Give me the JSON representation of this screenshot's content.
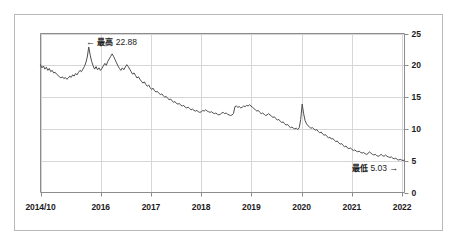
{
  "figure": {
    "name": "interest-rate-history-line-chart",
    "background_color": "#ffffff",
    "frame_color": "#b9b9b9",
    "line_color": "#4d4d4d",
    "grid_color": "#d6d6d6",
    "axis_color": "#8c8c8c"
  },
  "annotations": {
    "high": {
      "arrow": "←",
      "label": "最高",
      "value": "22.88",
      "full": "← 最高 22.88"
    },
    "low": {
      "arrow": "→",
      "label": "最低",
      "value": "5.03",
      "full": "最低 5.03→"
    }
  },
  "chart_data": {
    "type": "line",
    "title": "",
    "subtitle": "",
    "xlabel": "",
    "ylabel": "",
    "grid": true,
    "legend": null,
    "ylim": [
      0,
      25
    ],
    "yticks": [
      0,
      5,
      10,
      15,
      20,
      25
    ],
    "ytick_labels": [
      "0",
      "5",
      "10",
      "15",
      "20",
      "25"
    ],
    "xlim": [
      "2014/10",
      "2022"
    ],
    "xticks": [
      "2014/10",
      "2016",
      "2017",
      "2018",
      "2019",
      "2020",
      "2021",
      "2022"
    ],
    "xtick_labels": [
      "2014/10",
      "2016",
      "2017",
      "2018",
      "2019",
      "2020",
      "2021",
      "2022"
    ],
    "xtick_fractions": [
      0.0,
      0.1653,
      0.3033,
      0.4413,
      0.5793,
      0.7173,
      0.8553,
      0.9933
    ],
    "max_value": 22.88,
    "min_value": 5.03,
    "series": [
      {
        "name": "rate",
        "values": [
          20.1,
          19.6,
          19.9,
          19.4,
          19.7,
          19.2,
          19.5,
          19.0,
          19.2,
          18.8,
          18.9,
          18.6,
          18.4,
          18.2,
          18.0,
          18.2,
          17.9,
          18.1,
          17.8,
          18.0,
          18.3,
          18.1,
          18.5,
          18.3,
          18.7,
          18.5,
          18.9,
          19.2,
          19.0,
          19.4,
          19.8,
          20.4,
          21.3,
          22.88,
          21.6,
          20.6,
          19.9,
          19.4,
          19.8,
          19.3,
          19.6,
          19.2,
          19.5,
          19.9,
          20.3,
          20.0,
          20.6,
          21.0,
          21.4,
          21.8,
          21.4,
          20.9,
          20.4,
          19.9,
          19.5,
          19.2,
          19.6,
          19.3,
          19.7,
          20.1,
          19.8,
          19.4,
          19.0,
          18.6,
          18.8,
          18.4,
          18.0,
          18.2,
          17.8,
          17.5,
          17.2,
          17.4,
          17.0,
          16.7,
          16.9,
          16.5,
          16.2,
          16.4,
          16.0,
          15.8,
          15.9,
          15.6,
          15.4,
          15.5,
          15.2,
          15.0,
          15.1,
          14.8,
          14.6,
          14.7,
          14.4,
          14.2,
          14.3,
          14.0,
          13.9,
          14.0,
          13.7,
          13.6,
          13.7,
          13.4,
          13.3,
          13.4,
          13.2,
          13.0,
          13.1,
          12.9,
          12.8,
          12.9,
          12.7,
          12.6,
          12.7,
          12.9,
          12.8,
          13.0,
          12.8,
          12.7,
          12.6,
          12.7,
          12.5,
          12.4,
          12.5,
          12.3,
          12.2,
          12.3,
          12.5,
          12.6,
          12.4,
          12.5,
          12.3,
          12.2,
          12.1,
          12.2,
          12.4,
          13.5,
          13.6,
          13.4,
          13.5,
          13.3,
          13.4,
          13.6,
          13.5,
          13.7,
          13.6,
          13.8,
          13.6,
          13.4,
          13.2,
          13.0,
          12.8,
          12.9,
          12.6,
          12.4,
          12.5,
          12.3,
          12.1,
          12.2,
          12.4,
          12.2,
          12.0,
          11.8,
          11.9,
          11.6,
          11.4,
          11.5,
          11.2,
          11.0,
          11.1,
          10.8,
          10.6,
          10.7,
          10.4,
          10.2,
          10.3,
          10.1,
          10.0,
          10.1,
          9.9,
          10.2,
          11.5,
          13.9,
          12.4,
          11.3,
          10.8,
          10.5,
          10.3,
          10.1,
          10.2,
          10.0,
          9.8,
          9.9,
          9.6,
          9.4,
          9.5,
          9.2,
          9.0,
          9.1,
          8.8,
          8.6,
          8.7,
          8.4,
          8.5,
          8.2,
          8.0,
          8.1,
          7.8,
          7.6,
          7.7,
          7.4,
          7.2,
          7.3,
          7.0,
          6.9,
          7.0,
          6.8,
          6.6,
          6.7,
          6.5,
          6.4,
          6.5,
          6.3,
          6.2,
          6.3,
          6.1,
          6.0,
          6.1,
          6.4,
          6.2,
          6.0,
          5.9,
          6.0,
          5.8,
          5.7,
          5.8,
          6.0,
          5.8,
          5.7,
          5.9,
          5.7,
          5.6,
          5.5,
          5.6,
          5.4,
          5.3,
          5.4,
          5.2,
          5.1,
          5.2,
          5.1,
          5.03,
          5.1
        ]
      }
    ]
  }
}
